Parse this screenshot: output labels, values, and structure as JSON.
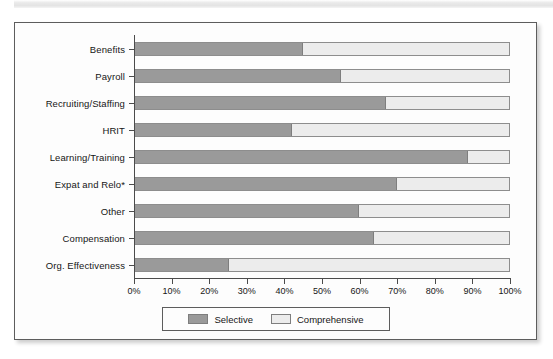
{
  "figure": {
    "scan_band_name": "page-scan-band"
  },
  "chart_data": {
    "type": "bar",
    "orientation": "horizontal",
    "stacked": true,
    "normalized": "100%",
    "title": "",
    "subtitle": "",
    "xlabel": "",
    "ylabel": "",
    "xlim": [
      0,
      100
    ],
    "grid": false,
    "legend_position": "bottom-center",
    "categories": [
      "Benefits",
      "Payroll",
      "Recruiting/Staffing",
      "HRIT",
      "Learning/Training",
      "Expat and Relo*",
      "Other",
      "Compensation",
      "Org. Effectiveness"
    ],
    "series": [
      {
        "name": "Selective",
        "color": "#9a9a9a",
        "values": [
          45,
          55,
          67,
          42,
          89,
          70,
          60,
          64,
          25
        ]
      },
      {
        "name": "Comprehensive",
        "color": "#ececec",
        "values": [
          55,
          45,
          33,
          58,
          11,
          30,
          40,
          36,
          75
        ]
      }
    ],
    "xticks": [
      0,
      10,
      20,
      30,
      40,
      50,
      60,
      70,
      80,
      90,
      100
    ],
    "xticklabels": [
      "0%",
      "10%",
      "20%",
      "30%",
      "40%",
      "50%",
      "60%",
      "70%",
      "80%",
      "90%",
      "100%"
    ]
  },
  "legend": {
    "entries": [
      {
        "label": "Selective",
        "swatch": "selective"
      },
      {
        "label": "Comprehensive",
        "swatch": "comprehensive"
      }
    ]
  }
}
